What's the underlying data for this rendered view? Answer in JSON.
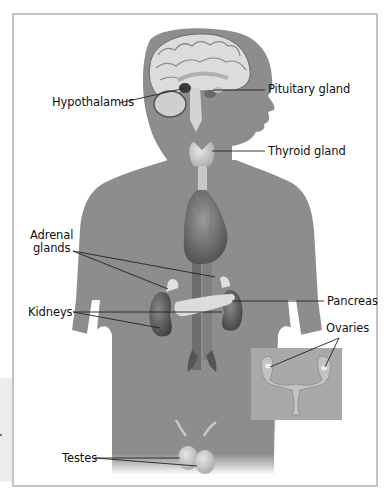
{
  "diagram": {
    "colors": {
      "frame_border": "#c4c4c4",
      "body_silhouette": "#8d8d8d",
      "organ_light": "#d9d9d9",
      "inset_background": "#a9a9a9",
      "leader_line": "#222222"
    },
    "labels": {
      "hypothalamus": "Hypothalamus",
      "pituitary": "Pituitary gland",
      "thyroid": "Thyroid gland",
      "adrenal_line1": "Adrenal",
      "adrenal_line2": "glands",
      "kidneys": "Kidneys",
      "pancreas": "Pancreas",
      "ovaries": "Ovaries",
      "testes": "Testes"
    }
  }
}
